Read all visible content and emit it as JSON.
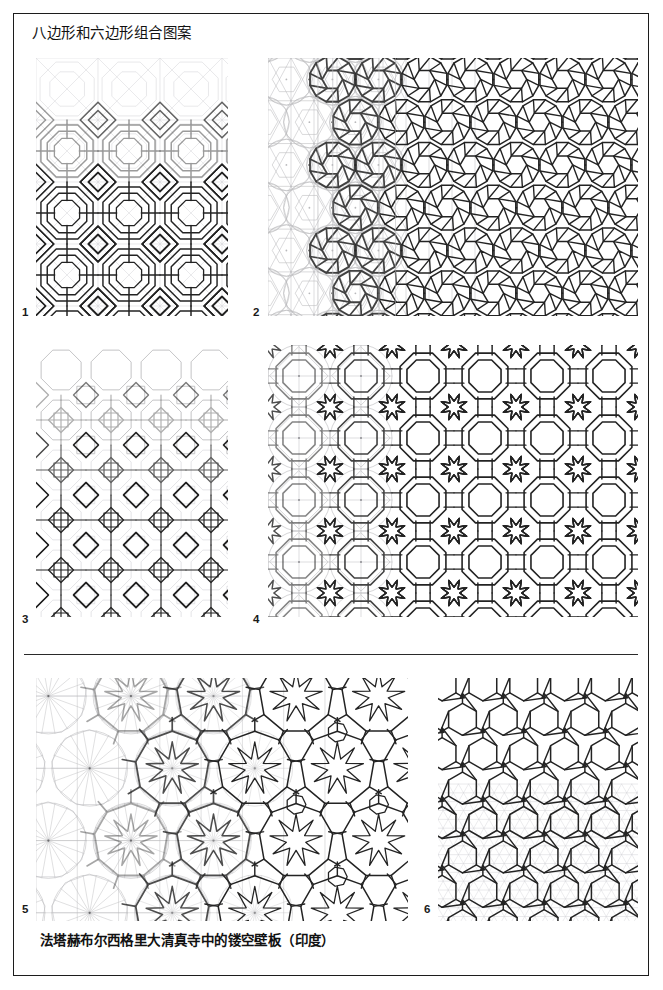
{
  "page": {
    "title": "八边形和六边形组合图案",
    "caption": "法塔赫布尔西格里大清真寺中的镂空壁板（印度）",
    "border_color": "#1c1c1c",
    "background": "#ffffff",
    "width": 663,
    "height": 990
  },
  "ink": {
    "final_stroke": "#232323",
    "construction_stroke": "#b9b9bc",
    "mid_stroke": "#6d6d70",
    "faint_stroke": "#d8d8dc"
  },
  "plates": [
    {
      "number": "1",
      "label_x": 22,
      "label_y": 306,
      "x": 36,
      "y": 58,
      "w": 192,
      "h": 258,
      "pattern_type": "octagon-square-interlace",
      "cell": 62,
      "construction_reveal": "top-rows-faint",
      "description": "八边形与正方形交织图案，上部为浅色作图辅助线"
    },
    {
      "number": "2",
      "label_x": 253,
      "label_y": 306,
      "x": 268,
      "y": 58,
      "w": 370,
      "h": 258,
      "pattern_type": "dodecagon-hexagon-rosette",
      "cell": 46,
      "construction_reveal": "left-columns-circles",
      "description": "十二边形与六边形玫瑰花结图案，左侧显示作图圆与三角网格"
    },
    {
      "number": "3",
      "label_x": 22,
      "label_y": 613,
      "x": 36,
      "y": 345,
      "w": 192,
      "h": 272,
      "pattern_type": "octagon-square-tiling",
      "cell": 50,
      "construction_reveal": "top-light-bottom-dark",
      "description": "八边形与正方形密铺，上部浅色，下部叠加深色斜向网格"
    },
    {
      "number": "4",
      "label_x": 253,
      "label_y": 613,
      "x": 268,
      "y": 345,
      "w": 370,
      "h": 272,
      "pattern_type": "octagon-star-interlace",
      "cell": 62,
      "construction_reveal": "left-circles-grid",
      "description": "八角星与八边形交织图案，左侧显示作图圆与菱形网格"
    },
    {
      "number": "5",
      "label_x": 22,
      "label_y": 903,
      "x": 36,
      "y": 678,
      "w": 372,
      "h": 243,
      "pattern_type": "nonagon-star-rosette",
      "cell": 86,
      "construction_reveal": "left-radial-circles",
      "description": "九边形与九角星玫瑰花结，自左向右由作图圆逐步生成图案"
    },
    {
      "number": "6",
      "label_x": 424,
      "label_y": 903,
      "x": 438,
      "y": 678,
      "w": 200,
      "h": 243,
      "pattern_type": "hexagon-triangle-grid",
      "cell": 40,
      "construction_reveal": "bottom-triangle-grid",
      "description": "六边形图案，下部显示三角形作图网格"
    }
  ],
  "divider": {
    "x": 24,
    "y": 654,
    "w": 614
  }
}
